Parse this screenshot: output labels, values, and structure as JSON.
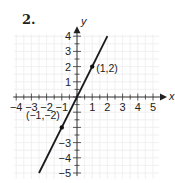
{
  "problem": {
    "number": "2."
  },
  "chart_data": {
    "type": "line",
    "title": "",
    "xlabel": "x",
    "ylabel": "y",
    "xlim": [
      -4,
      5
    ],
    "ylim": [
      -5,
      4
    ],
    "grid": true,
    "x_ticks": [
      -4,
      -3,
      -2,
      -1,
      1,
      2,
      3,
      4,
      5
    ],
    "y_ticks": [
      -5,
      -4,
      -3,
      -2,
      -1,
      1,
      2,
      3,
      4
    ],
    "x_tick_labels": [
      "−4",
      "−3",
      "−2",
      "−1",
      "1",
      "2",
      "3",
      "4",
      "5"
    ],
    "y_tick_labels_shown": [
      "4",
      "3",
      "2",
      "1",
      "−3",
      "−4",
      "−5"
    ],
    "series": [
      {
        "name": "y = 2x",
        "equation": "y = 2x",
        "x": [
          -2.5,
          2
        ],
        "y": [
          -5,
          4
        ],
        "color": "#1a1a1a"
      }
    ],
    "points": [
      {
        "x": 1,
        "y": 2,
        "label": "(1,2)"
      },
      {
        "x": -1,
        "y": -2,
        "label": "(−1,−2)"
      }
    ]
  }
}
